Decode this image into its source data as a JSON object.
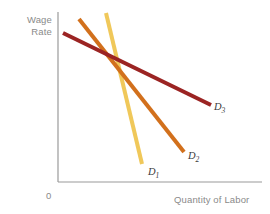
{
  "figure": {
    "background": "#ffffff",
    "axis_color": "#9a9a9a",
    "text_color": "#8a8a8a"
  },
  "labels": {
    "ylabel_line1": "Wage",
    "ylabel_line2": "Rate",
    "xlabel": "Quantity of Labor",
    "origin": "0"
  },
  "curves": [
    {
      "id": "D1",
      "name": "D",
      "subscript": "1",
      "color": "#F0C85A"
    },
    {
      "id": "D2",
      "name": "D",
      "subscript": "2",
      "color": "#D2701C"
    },
    {
      "id": "D3",
      "name": "D",
      "subscript": "3",
      "color": "#9B2423"
    }
  ],
  "chart_data": {
    "type": "line",
    "title": "",
    "xlabel": "Quantity of Labor",
    "ylabel": "Wage Rate",
    "xlim": [
      0,
      270
    ],
    "ylim": [
      0,
      214
    ],
    "grid": false,
    "legend": "inline-curve-labels",
    "axes": {
      "y_axis": {
        "x": 58,
        "y_top": 12,
        "y_bottom": 182
      },
      "x_axis": {
        "y": 182,
        "x_left": 58,
        "x_right": 262
      },
      "origin_px": [
        58,
        182
      ]
    },
    "series": [
      {
        "name": "D1",
        "label": "D₁",
        "color": "#F0C85A",
        "linewidth": 4.0,
        "points_px": [
          [
            106,
            13
          ],
          [
            142,
            164
          ]
        ],
        "description": "Steepest labor demand curve, least elastic, pale yellow"
      },
      {
        "name": "D2",
        "label": "D₂",
        "color": "#D2701C",
        "linewidth": 4.0,
        "points_px": [
          [
            79,
            19
          ],
          [
            184,
            152
          ]
        ],
        "description": "Intermediate slope labor demand curve, orange"
      },
      {
        "name": "D3",
        "label": "D₃",
        "color": "#9B2423",
        "linewidth": 4.0,
        "points_px": [
          [
            63,
            33
          ],
          [
            211,
            105
          ]
        ],
        "description": "Flattest labor demand curve, most elastic, dark red"
      }
    ],
    "annotations": [
      {
        "text": "D₁",
        "x_px": 152,
        "y_px": 172
      },
      {
        "text": "D₂",
        "x_px": 192,
        "y_px": 156
      },
      {
        "text": "D₃",
        "x_px": 218,
        "y_px": 107
      }
    ],
    "intersection_px": [
      112,
      66
    ]
  }
}
